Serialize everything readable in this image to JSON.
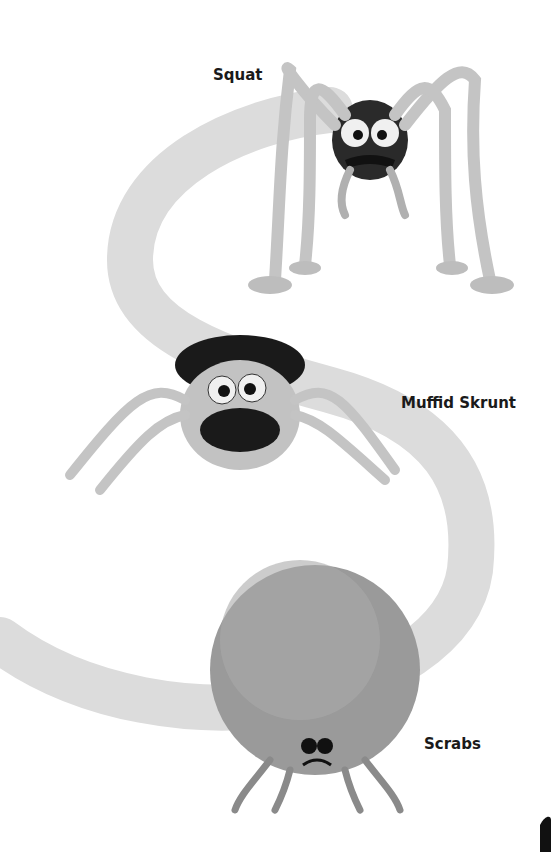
{
  "labels": {
    "squat": "Squat",
    "muffid": "Muffid Skrunt",
    "scrabs": "Scrabs"
  },
  "colors": {
    "path": "#d9d9d9",
    "creature": "#b8b8b8",
    "creature_dark": "#707070",
    "fur": "#1a1a1a"
  }
}
